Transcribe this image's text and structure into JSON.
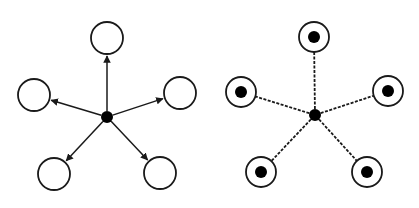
{
  "colors": {
    "stroke": "#1a1a1a",
    "fill": "#000000",
    "background": "#ffffff"
  },
  "diagrams": [
    {
      "name": "star-topology-arrows",
      "hub": {
        "x": 107,
        "y": 117,
        "r": 6
      },
      "edge_style": "solid-arrow",
      "nodes": [
        {
          "x": 107,
          "y": 38,
          "r": 16,
          "inner_dot": false
        },
        {
          "x": 180,
          "y": 93,
          "r": 16,
          "inner_dot": false
        },
        {
          "x": 160,
          "y": 173,
          "r": 16,
          "inner_dot": false
        },
        {
          "x": 54,
          "y": 174,
          "r": 16,
          "inner_dot": false
        },
        {
          "x": 34,
          "y": 95,
          "r": 16,
          "inner_dot": false
        }
      ]
    },
    {
      "name": "star-topology-dashed",
      "hub": {
        "x": 315,
        "y": 115,
        "r": 6
      },
      "edge_style": "dashed",
      "nodes": [
        {
          "x": 314,
          "y": 37,
          "r": 15,
          "inner_dot": true
        },
        {
          "x": 388,
          "y": 91,
          "r": 15,
          "inner_dot": true
        },
        {
          "x": 367,
          "y": 172,
          "r": 15,
          "inner_dot": true
        },
        {
          "x": 261,
          "y": 172,
          "r": 15,
          "inner_dot": true
        },
        {
          "x": 241,
          "y": 92,
          "r": 15,
          "inner_dot": true
        }
      ]
    }
  ]
}
